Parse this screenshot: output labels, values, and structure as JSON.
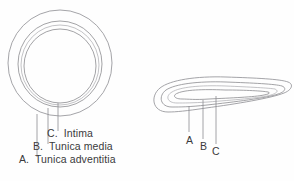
{
  "figure": {
    "background_color": "#fefefe",
    "line_color": "#8b8b8f",
    "text_color": "#3a3a3c",
    "views": [
      {
        "name": "cross-section",
        "description": "Concentric ring cross-section of vessel wall",
        "ring_count": 4
      },
      {
        "name": "longitudinal-section",
        "description": "Elongated nested loop longitudinal section of vessel wall",
        "contour_count": 4
      }
    ]
  },
  "legend": {
    "items": [
      {
        "key": "C",
        "letter": "C.",
        "name": "Intima",
        "full": "C.  Intima"
      },
      {
        "key": "B",
        "letter": "B.",
        "name": "Tunica media",
        "full": "B.  Tunica media"
      },
      {
        "key": "A",
        "letter": "A.",
        "name": "Tunica adventitia",
        "full": "A.  Tunica adventitia"
      }
    ]
  },
  "right_labels": {
    "a": "A",
    "b": "B",
    "c": "C"
  }
}
